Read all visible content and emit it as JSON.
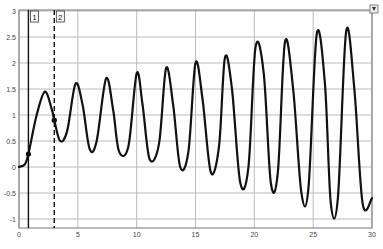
{
  "chart_data": {
    "type": "line",
    "title": "",
    "xlabel": "",
    "ylabel": "",
    "xlim": [
      0,
      30
    ],
    "ylim": [
      -1.1,
      3
    ],
    "grid": true,
    "x_ticks": [
      0,
      5,
      10,
      15,
      20,
      25,
      30
    ],
    "x_tick_labels": [
      "0",
      "5",
      "10",
      "15",
      "20",
      "25",
      "30"
    ],
    "y_ticks": [
      3,
      2.5,
      2,
      1.5,
      1,
      0.5,
      0,
      -0.5,
      -1
    ],
    "y_tick_labels": [
      "3",
      "2.5",
      "2",
      "1.5",
      "1",
      "0.5",
      "0",
      "-0.5",
      "-1"
    ],
    "series": [
      {
        "name": "signal",
        "color": "#111111",
        "x": [
          0,
          0.5,
          0.8,
          1.5,
          2.2,
          2.8,
          3.0,
          3.5,
          4.1,
          4.8,
          5.4,
          6.0,
          6.6,
          7.4,
          8.0,
          8.5,
          9.3,
          10.0,
          10.5,
          11.1,
          11.9,
          12.5,
          13.1,
          13.7,
          14.4,
          15.0,
          15.6,
          16.3,
          17.0,
          17.5,
          18.1,
          18.8,
          19.5,
          20.1,
          20.8,
          21.4,
          22.0,
          22.6,
          23.3,
          24.0,
          24.6,
          25.3,
          26.0,
          26.5,
          27.1,
          27.8,
          28.5,
          29.2,
          30.0
        ],
        "y": [
          0,
          0.05,
          0.25,
          1.0,
          1.45,
          1.1,
          0.9,
          0.5,
          0.7,
          1.6,
          1.2,
          0.35,
          0.5,
          1.7,
          1.1,
          0.3,
          0.4,
          1.8,
          1.2,
          0.15,
          0.45,
          1.9,
          1.2,
          0.0,
          0.3,
          2.0,
          1.3,
          -0.1,
          0.4,
          2.1,
          1.5,
          -0.3,
          0.0,
          2.3,
          1.8,
          -0.3,
          -0.1,
          2.4,
          1.5,
          -0.5,
          -0.4,
          2.55,
          1.6,
          -0.7,
          -0.6,
          2.6,
          1.5,
          -0.7,
          -0.6
        ]
      }
    ],
    "markers": [
      {
        "x": 0.8,
        "y": 0.25
      },
      {
        "x": 3.0,
        "y": 0.9
      }
    ],
    "cursors": [
      {
        "label": "1",
        "x": 0.8,
        "style": "solid"
      },
      {
        "label": "2",
        "x": 3.0,
        "style": "dashed"
      }
    ],
    "legend": null
  },
  "controls": {
    "corner_button_icon": "expand-icon"
  }
}
